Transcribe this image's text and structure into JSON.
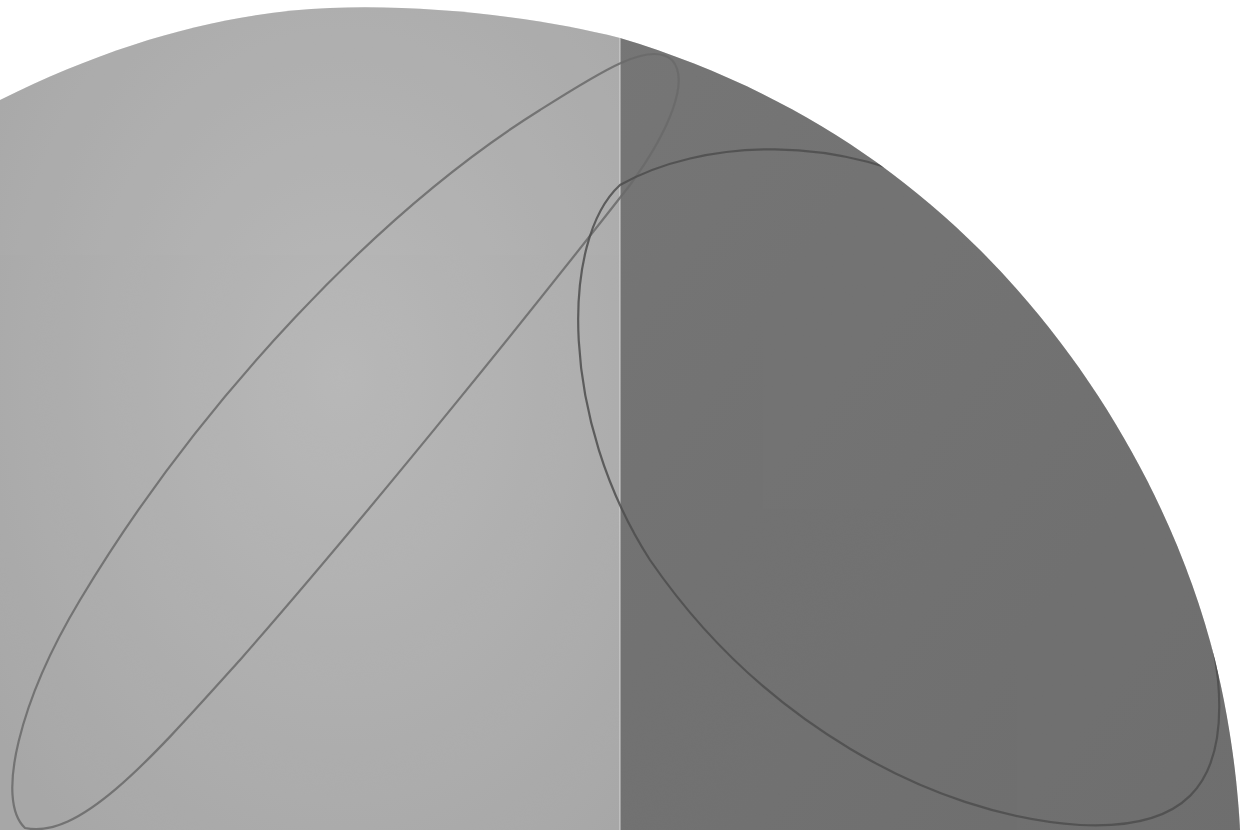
{
  "artwork": {
    "description": "Shaped canvas painting: quarter-circle-like arc top edge, split vertically into a light gray left panel and a dark gray right panel, with thin graphite ellipse lines drawn across both.",
    "colors": {
      "background": "#ffffff",
      "light_panel": "#b9b9b9",
      "light_panel_highlight": "#c8c8c8",
      "dark_panel": "#6e6e6e",
      "dark_panel_shade": "#656565",
      "line": "#5a5a5a"
    },
    "panels": [
      {
        "name": "light-panel",
        "x_start": 0,
        "x_end": 620
      },
      {
        "name": "dark-panel",
        "x_start": 620,
        "x_end": 1240
      }
    ]
  }
}
